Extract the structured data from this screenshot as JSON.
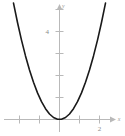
{
  "chart_data": {
    "type": "line",
    "title": "",
    "subtitle": "",
    "xlabel": "x",
    "ylabel": "y",
    "equation": "y = x^2",
    "xlim": [
      -2.3,
      2.3
    ],
    "ylim": [
      -0.8,
      5.3
    ],
    "grid": false,
    "legend": null,
    "x_ticks": [
      -2,
      -1,
      1,
      2
    ],
    "x_tick_labels": [
      "",
      "",
      "",
      "2"
    ],
    "y_ticks": [
      1,
      2,
      3,
      4,
      5
    ],
    "y_tick_labels": [
      "",
      "",
      "",
      "4",
      ""
    ],
    "series": [
      {
        "name": "y = x^2",
        "color": "#1a1a1a",
        "x": [
          -2.3,
          -2.1,
          -1.9,
          -1.7,
          -1.5,
          -1.3,
          -1.1,
          -0.9,
          -0.7,
          -0.5,
          -0.3,
          -0.1,
          0.1,
          0.3,
          0.5,
          0.7,
          0.9,
          1.1,
          1.3,
          1.5,
          1.7,
          1.9,
          2.1,
          2.3
        ],
        "values": [
          5.29,
          4.41,
          3.61,
          2.89,
          2.25,
          1.69,
          1.21,
          0.81,
          0.49,
          0.25,
          0.09,
          0.01,
          0.01,
          0.09,
          0.25,
          0.49,
          0.81,
          1.21,
          1.69,
          2.25,
          2.89,
          3.61,
          4.41,
          5.29
        ]
      }
    ],
    "annotations": []
  },
  "axes": {
    "x_axis_label": "x",
    "y_axis_label": "y",
    "x_tick_2_label": "2",
    "y_tick_4_label": "4"
  },
  "colors": {
    "background": "#ffffff",
    "axis": "#b9b9b9",
    "curve": "#1a1a1a",
    "tick_text": "#8a8a8a",
    "axis_text": "#9a9a9a"
  }
}
